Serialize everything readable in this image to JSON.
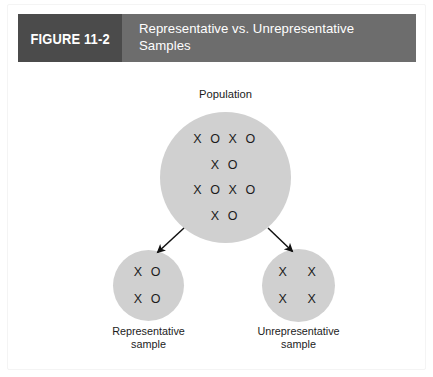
{
  "figure": {
    "number_label": "FIGURE 11-2",
    "title": "Representative vs. Unrepresentative Samples",
    "colors": {
      "header_bar": "#6d6d6d",
      "number_box": "#4b4b4b",
      "circle_fill": "#d0d0d0",
      "mark_text": "#1c1c1c",
      "title_text": "#ffffff",
      "page_background": "#ffffff"
    }
  },
  "diagram": {
    "population": {
      "label": "Population",
      "mark_rows": [
        "X O X O",
        "X O",
        "X O X O",
        "X O"
      ]
    },
    "samples": [
      {
        "name": "representative",
        "caption_line1": "Representative",
        "caption_line2": "sample",
        "mark_rows": [
          "X O",
          "X O"
        ]
      },
      {
        "name": "unrepresentative",
        "caption_line1": "Unrepresentative",
        "caption_line2": "sample",
        "mark_rows": [
          "X   X",
          "X   X"
        ]
      }
    ],
    "arrows": [
      {
        "name": "arrow-to-representative-sample",
        "direction": "down-left"
      },
      {
        "name": "arrow-to-unrepresentative-sample",
        "direction": "down-right"
      }
    ]
  }
}
